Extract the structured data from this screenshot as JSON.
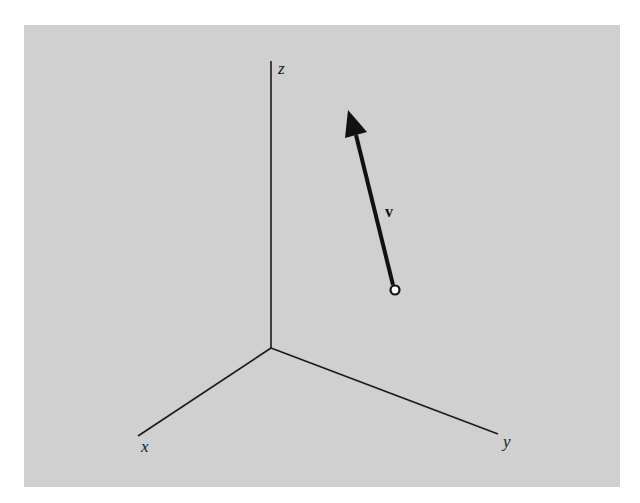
{
  "figure": {
    "type": "3d-vector-diagram",
    "axes": [
      {
        "name": "x",
        "label": "x"
      },
      {
        "name": "y",
        "label": "y"
      },
      {
        "name": "z",
        "label": "z"
      }
    ],
    "vector": {
      "label": "v",
      "tail_marker": "open-circle",
      "head_marker": "arrow"
    }
  },
  "colors": {
    "background_panel": "#d0d0d0",
    "ink": "#111111"
  }
}
